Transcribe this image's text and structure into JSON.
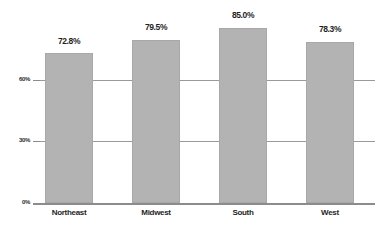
{
  "chart_data": {
    "type": "bar",
    "title": "",
    "subtitle": "",
    "xlabel": "",
    "ylabel": "",
    "categories": [
      "Northeast",
      "Midwest",
      "South",
      "West"
    ],
    "values": [
      72.8,
      79.5,
      85.0,
      78.3
    ],
    "value_labels": [
      "72.8%",
      "79.5%",
      "85.0%",
      "78.3%"
    ],
    "ylim": [
      0,
      90
    ],
    "ytick_values": [
      0,
      30,
      60
    ],
    "ytick_labels": [
      "0%",
      "30%",
      "60%"
    ],
    "grid": true,
    "grid_axis": "y",
    "legend": false,
    "legend_position": "none",
    "series": [
      {
        "name": "",
        "values": [
          72.8,
          79.5,
          85.0,
          78.3
        ]
      }
    ],
    "colors": {
      "bar_fill": "#b3b3b3",
      "bar_edge": "#a8a8a8",
      "gridline": "#9a9a9a",
      "axis": "#8c8c8c",
      "label_text": "#1f1f1f",
      "tick_text": "#2b2b2b",
      "background": "#ffffff"
    }
  }
}
